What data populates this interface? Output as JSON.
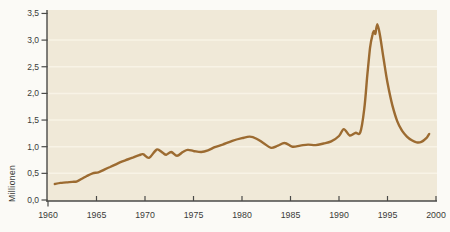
{
  "figure": {
    "y_axis_title": "Millionen"
  },
  "chart_data": {
    "type": "line",
    "title": "",
    "xlabel": "",
    "ylabel": "Millionen",
    "x_range": [
      1960,
      2000
    ],
    "y_range": [
      0,
      3.5
    ],
    "grid": "horizontal-only",
    "legend": "none",
    "x_tick_values": [
      1960,
      1965,
      1970,
      1975,
      1980,
      1985,
      1990,
      1995,
      2000
    ],
    "x_tick_labels": [
      "1960",
      "1965",
      "1970",
      "1975",
      "1980",
      "1985",
      "1990",
      "1995",
      "2000"
    ],
    "y_tick_values": [
      0,
      0.5,
      1.0,
      1.5,
      2.0,
      2.5,
      3.0,
      3.5
    ],
    "y_tick_labels": [
      "0,0",
      "0,5",
      "1,0",
      "1,5",
      "2,0",
      "2,5",
      "3,0",
      "3,5"
    ],
    "series": [
      {
        "name": "Millionen",
        "points": [
          [
            1960.7,
            0.3
          ],
          [
            1961.3,
            0.32
          ],
          [
            1961.9,
            0.33
          ],
          [
            1962.5,
            0.34
          ],
          [
            1963.0,
            0.35
          ],
          [
            1963.5,
            0.4
          ],
          [
            1964.0,
            0.45
          ],
          [
            1964.6,
            0.5
          ],
          [
            1965.2,
            0.52
          ],
          [
            1965.8,
            0.57
          ],
          [
            1966.4,
            0.62
          ],
          [
            1967.0,
            0.67
          ],
          [
            1967.6,
            0.72
          ],
          [
            1968.2,
            0.76
          ],
          [
            1968.8,
            0.8
          ],
          [
            1969.4,
            0.84
          ],
          [
            1969.8,
            0.86
          ],
          [
            1970.4,
            0.79
          ],
          [
            1971.0,
            0.91
          ],
          [
            1971.3,
            0.95
          ],
          [
            1971.8,
            0.89
          ],
          [
            1972.2,
            0.85
          ],
          [
            1972.7,
            0.9
          ],
          [
            1973.3,
            0.83
          ],
          [
            1973.9,
            0.9
          ],
          [
            1974.4,
            0.94
          ],
          [
            1975.0,
            0.92
          ],
          [
            1975.8,
            0.9
          ],
          [
            1976.5,
            0.93
          ],
          [
            1977.2,
            0.99
          ],
          [
            1978.0,
            1.04
          ],
          [
            1979.0,
            1.11
          ],
          [
            1980.0,
            1.16
          ],
          [
            1980.8,
            1.19
          ],
          [
            1981.5,
            1.15
          ],
          [
            1982.2,
            1.07
          ],
          [
            1983.0,
            0.98
          ],
          [
            1983.7,
            1.02
          ],
          [
            1984.4,
            1.07
          ],
          [
            1985.2,
            1.0
          ],
          [
            1986.0,
            1.02
          ],
          [
            1986.8,
            1.04
          ],
          [
            1987.6,
            1.03
          ],
          [
            1988.4,
            1.06
          ],
          [
            1989.2,
            1.1
          ],
          [
            1990.0,
            1.2
          ],
          [
            1990.5,
            1.33
          ],
          [
            1991.1,
            1.21
          ],
          [
            1991.7,
            1.26
          ],
          [
            1992.2,
            1.27
          ],
          [
            1992.6,
            1.7
          ],
          [
            1992.9,
            2.3
          ],
          [
            1993.2,
            2.85
          ],
          [
            1993.45,
            3.1
          ],
          [
            1993.6,
            3.17
          ],
          [
            1993.75,
            3.12
          ],
          [
            1993.95,
            3.3
          ],
          [
            1994.2,
            3.12
          ],
          [
            1994.6,
            2.65
          ],
          [
            1995.0,
            2.2
          ],
          [
            1995.5,
            1.78
          ],
          [
            1996.0,
            1.48
          ],
          [
            1996.5,
            1.3
          ],
          [
            1997.0,
            1.19
          ],
          [
            1997.5,
            1.12
          ],
          [
            1998.0,
            1.08
          ],
          [
            1998.5,
            1.09
          ],
          [
            1999.0,
            1.16
          ],
          [
            1999.3,
            1.24
          ]
        ]
      }
    ],
    "colors": {
      "line": "#9c6b31",
      "plot_background": "#f0e9d8",
      "gridline": "#f8f3e6",
      "axis": "#4a4a48",
      "tick_label": "#3a3a38",
      "page_background": "#fbfaf6"
    }
  }
}
